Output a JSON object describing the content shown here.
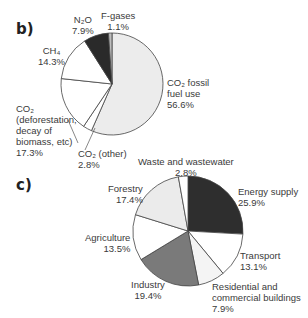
{
  "chart_data": [
    {
      "panel": "b)",
      "type": "pie",
      "title": "",
      "center": [
        112,
        84
      ],
      "radius": 51,
      "start_angle_deg": 0,
      "direction": "clockwise",
      "slices": [
        {
          "name": "CO2 fossil fuel use",
          "label_main": "CO₂ fossil\nfuel use",
          "value": 56.6,
          "value_label": "56.6%",
          "color": "#ececec"
        },
        {
          "name": "CO2 (other)",
          "label_main": "CO₂ (other)",
          "value": 2.8,
          "value_label": "2.8%",
          "color": "#ffffff"
        },
        {
          "name": "CO2 (deforestation, decay of biomass, etc)",
          "label_main": "CO₂\n(deforestation,\ndecay of\nbiomass, etc)",
          "value": 17.3,
          "value_label": "17.3%",
          "color": "#ffffff"
        },
        {
          "name": "CH4",
          "label_main": "CH₄",
          "value": 14.3,
          "value_label": "14.3%",
          "color": "#ffffff"
        },
        {
          "name": "N2O",
          "label_main": "N₂O",
          "value": 7.9,
          "value_label": "7.9%",
          "color": "#2a2a2a"
        },
        {
          "name": "F-gases",
          "label_main": "F-gases",
          "value": 1.1,
          "value_label": "1.1%",
          "color": "#bdbdbd"
        }
      ]
    },
    {
      "panel": "c)",
      "type": "pie",
      "title": "",
      "center": [
        188,
        231
      ],
      "radius": 55,
      "start_angle_deg": 0,
      "direction": "clockwise",
      "slices": [
        {
          "name": "Energy supply",
          "label_main": "Energy supply",
          "value": 25.9,
          "value_label": "25.9%",
          "color": "#2e2e2e"
        },
        {
          "name": "Transport",
          "label_main": "Transport",
          "value": 13.1,
          "value_label": "13.1%",
          "color": "#ffffff"
        },
        {
          "name": "Residential and commercial buildings",
          "label_main": "Residential and\ncommercial buildings",
          "value": 7.9,
          "value_label": "7.9%",
          "color": "#f4f4f4"
        },
        {
          "name": "Industry",
          "label_main": "Industry",
          "value": 19.4,
          "value_label": "19.4%",
          "color": "#7a7a7a"
        },
        {
          "name": "Agriculture",
          "label_main": "Agriculture",
          "value": 13.5,
          "value_label": "13.5%",
          "color": "#ffffff"
        },
        {
          "name": "Forestry",
          "label_main": "Forestry",
          "value": 17.4,
          "value_label": "17.4%",
          "color": "#ebebeb"
        },
        {
          "name": "Waste and wastewater",
          "label_main": "Waste and wastewater",
          "value": 2.8,
          "value_label": "2.8%",
          "color": "#ffffff"
        }
      ]
    }
  ],
  "labels": {
    "panel_b": "b)",
    "panel_c": "c)",
    "b": {
      "fgases": "F-gases\n1.1%",
      "n2o": "N₂O\n7.9%",
      "ch4": "CH₄\n14.3%",
      "co2_fossil": "CO₂ fossil\nfuel use\n56.6%",
      "co2_defor": "CO₂\n(deforestation,\ndecay of\nbiomass, etc)\n17.3%",
      "co2_other": "CO₂ (other)\n2.8%"
    },
    "c": {
      "waste": "Waste and wastewater\n2.8%",
      "forestry": "Forestry\n17.4%",
      "energy": "Energy supply\n25.9%",
      "agriculture": "Agriculture\n13.5%",
      "transport": "Transport\n13.1%",
      "industry": "Industry\n19.4%",
      "residential": "Residential and\ncommercial buildings\n7.9%"
    }
  }
}
